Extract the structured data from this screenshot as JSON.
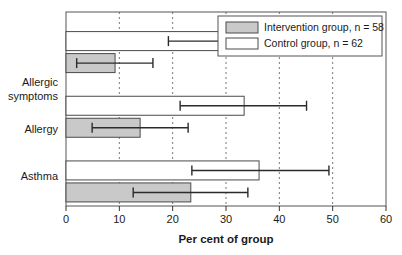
{
  "chart_data": {
    "type": "bar",
    "orientation": "horizontal",
    "title": "",
    "xlabel": "Per cent of group",
    "ylabel": "",
    "xlim": [
      0,
      60
    ],
    "xticks": [
      0,
      10,
      20,
      30,
      40,
      50,
      60
    ],
    "xtick_labels": [
      "0",
      "10",
      "20",
      "30",
      "40",
      "50",
      "60"
    ],
    "grid": "vertical-dashed",
    "legend_position": "top-right",
    "categories": [
      "Allergic symptoms",
      "Allergy",
      "Asthma"
    ],
    "category_lines": [
      [
        "Allergic",
        "symptoms"
      ],
      [
        "Allergy"
      ],
      [
        "Asthma"
      ]
    ],
    "series": [
      {
        "name": "Intervention group, n = 58",
        "short_name": "Intervention group",
        "n": 58,
        "fill": "#c9c9c9",
        "values": [
          9.2,
          13.9,
          23.4
        ],
        "ci_low": [
          2.0,
          4.9,
          12.6
        ],
        "ci_high": [
          16.3,
          22.9,
          34.1
        ]
      },
      {
        "name": "Control group, n = 62",
        "short_name": "Control group",
        "n": 62,
        "fill": "#ffffff",
        "values": [
          31.2,
          33.4,
          36.2
        ],
        "ci_low": [
          19.2,
          21.4,
          23.6
        ],
        "ci_high": [
          42.8,
          45.1,
          49.3
        ]
      }
    ]
  },
  "legend": {
    "entries": [
      {
        "label": "Intervention group, n = 58",
        "swatch": "#c9c9c9"
      },
      {
        "label": "Control group, n = 62",
        "swatch": "#ffffff"
      }
    ]
  },
  "axis": {
    "x_title": "Per cent of group",
    "tick_labels": [
      "0",
      "10",
      "20",
      "30",
      "40",
      "50",
      "60"
    ]
  },
  "categories": {
    "allergic_symptoms_line1": "Allergic",
    "allergic_symptoms_line2": "symptoms",
    "allergy": "Allergy",
    "asthma": "Asthma"
  },
  "colors": {
    "intervention_fill": "#c9c9c9",
    "control_fill": "#ffffff",
    "frame": "#555555",
    "grid": "#777777",
    "error_bar": "#2b2b2b",
    "text": "#1a1a1a"
  }
}
